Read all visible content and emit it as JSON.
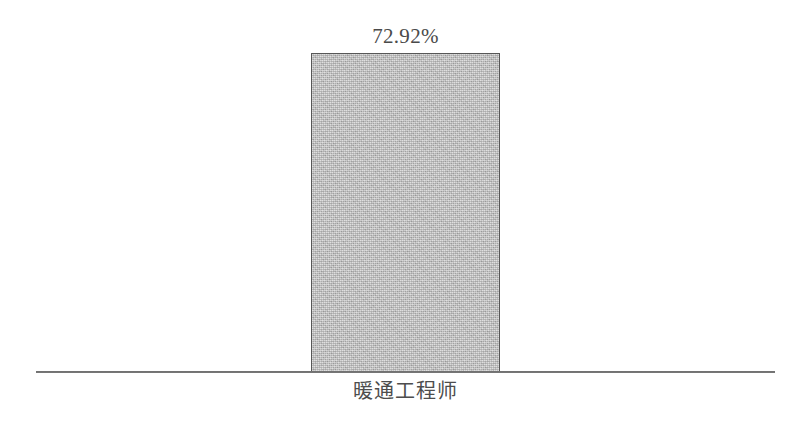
{
  "chart_data": {
    "type": "bar",
    "title": "",
    "subtitle": "",
    "xlabel": "",
    "ylabel": "",
    "categories": [
      "暖通工程师"
    ],
    "values": [
      72.92
    ],
    "value_labels": [
      "72.92%"
    ],
    "value_unit": "%",
    "ylim": [
      0,
      100
    ],
    "grid": false,
    "legend": null,
    "series": [
      {
        "name": "",
        "values": [
          72.92
        ],
        "labels": [
          "72.92%"
        ]
      }
    ],
    "annotations": [],
    "axis": {
      "baseline_visible": true,
      "y_axis_visible": false,
      "x_tick_labels": [
        "暖通工程师"
      ],
      "y_tick_labels": []
    },
    "colors": {
      "background": "#ffffff",
      "bar_fill": "#b9b9b9",
      "bar_border": "#575757",
      "axis_line": "#5a5a5a",
      "label_text": "#4a4a4a"
    }
  }
}
